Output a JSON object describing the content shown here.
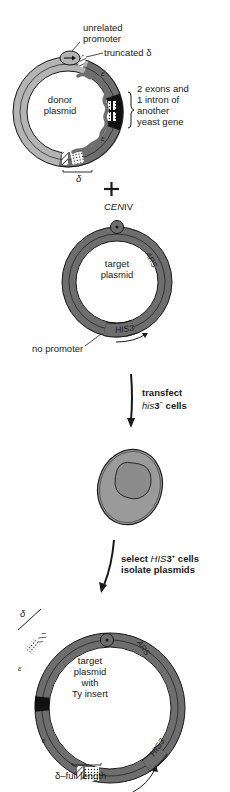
{
  "donor": {
    "label_line1": "donor",
    "label_line2": "plasmid",
    "promoter_line1": "unrelated",
    "promoter_line2": "promoter",
    "truncated": "truncated δ",
    "insert_line1": "2 exons and",
    "insert_line2": "1 intron of",
    "insert_line3": "another",
    "insert_line4": "yeast gene",
    "delta": "δ",
    "epsilon": "ε"
  },
  "plus": "+",
  "target": {
    "cen": "CEN",
    "cen_numeral": "IV",
    "label_line1": "target",
    "label_line2": "plasmid",
    "ars": "ARS",
    "his3": "HIS3",
    "no_promoter": "no promoter"
  },
  "step1": {
    "line1": "transfect",
    "line2_ital": "his",
    "line2_rest": "3",
    "line2_sup": "−",
    "line2_end": " cells"
  },
  "step2": {
    "line1_pre": "select ",
    "line1_ital": "HIS",
    "line1_mid": "3",
    "line1_sup": "+",
    "line1_end": " cells",
    "line2": "isolate plasmids"
  },
  "result": {
    "label_line1": "target",
    "label_line2": "plasmid",
    "label_line3": "with",
    "label_line4": "Ty insert",
    "ars": "ARS",
    "his3": "HIS3",
    "delta": "δ",
    "delta_full": "δ–full length",
    "epsilon": "ε"
  },
  "colors": {
    "ring_dark": "#6e6e6e",
    "ring_light": "#b4b4b4",
    "cell_fill": "#9a9a9a",
    "ink": "#1a1a1a"
  }
}
